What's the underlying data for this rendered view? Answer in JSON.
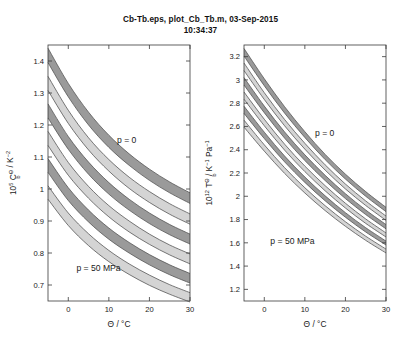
{
  "figure": {
    "title_line1": "Cb-Tb.eps, plot_Cb_Tb.m, 03-Sep-2015",
    "title_line2": "10:34:37",
    "background": "#ffffff"
  },
  "colors": {
    "band_dark": "#9a9a9a",
    "band_light": "#d4d4d4",
    "curve_line": "#4d4d4d",
    "axis": "#3a3a3a",
    "text": "#1a1a1a"
  },
  "panels": [
    {
      "id": "left",
      "annotations": [
        {
          "text": "p = 0",
          "x": 12.0,
          "y": 1.145
        },
        {
          "text": "p = 50 MPa",
          "x": 2.0,
          "y": 0.745
        }
      ]
    },
    {
      "id": "right",
      "annotations": [
        {
          "text": "p = 0",
          "x": 12.5,
          "y": 2.52
        },
        {
          "text": "p = 50 MPa",
          "x": 1.5,
          "y": 1.59
        }
      ]
    }
  ],
  "chart_data": [
    {
      "type": "line",
      "id": "left-panel",
      "title": "",
      "xlabel": "Θ / °C",
      "ylabel": "10⁵ C_b^Θ / K⁻²",
      "ylabel_parts": {
        "prefix": "10",
        "prefix_sup": "5",
        "symbol": "C",
        "symbol_sub": "b",
        "symbol_sup": "Θ",
        "unit": "/ K",
        "unit_sup": "−2"
      },
      "xlim": [
        -5,
        30
      ],
      "ylim": [
        0.65,
        1.45
      ],
      "xticks": [
        0,
        10,
        20,
        30
      ],
      "yticks": [
        0.7,
        0.8,
        0.9,
        1,
        1.1,
        1.2,
        1.3,
        1.4
      ],
      "xticklabels": [
        "0",
        "10",
        "20",
        "30"
      ],
      "yticklabels": [
        "0.7",
        "0.8",
        "0.9",
        "1",
        "1.1",
        "1.2",
        "1.3",
        "1.4"
      ],
      "grid": false,
      "legend": "none",
      "x": [
        -5,
        0,
        5,
        10,
        15,
        20,
        25,
        30
      ],
      "series": [
        {
          "name": "p = 0 upper",
          "pressure_MPa": 0,
          "bound": "upper",
          "values": [
            1.44,
            1.33,
            1.24,
            1.168,
            1.11,
            1.062,
            1.022,
            0.988
          ]
        },
        {
          "name": "p = 0 lower",
          "pressure_MPa": 0,
          "bound": "lower",
          "values": [
            1.395,
            1.288,
            1.2,
            1.13,
            1.074,
            1.027,
            0.988,
            0.955
          ]
        },
        {
          "name": "p = 10 upper",
          "pressure_MPa": 10,
          "bound": "upper",
          "values": [
            1.352,
            1.246,
            1.16,
            1.092,
            1.037,
            0.992,
            0.954,
            0.922
          ]
        },
        {
          "name": "p = 10 lower",
          "pressure_MPa": 10,
          "bound": "lower",
          "values": [
            1.308,
            1.205,
            1.122,
            1.056,
            1.002,
            0.958,
            0.921,
            0.89
          ]
        },
        {
          "name": "p = 20 upper",
          "pressure_MPa": 20,
          "bound": "upper",
          "values": [
            1.266,
            1.164,
            1.084,
            1.02,
            0.968,
            0.925,
            0.889,
            0.859
          ]
        },
        {
          "name": "p = 20 lower",
          "pressure_MPa": 20,
          "bound": "lower",
          "values": [
            1.222,
            1.124,
            1.046,
            0.984,
            0.934,
            0.892,
            0.857,
            0.828
          ]
        },
        {
          "name": "p = 30 upper",
          "pressure_MPa": 30,
          "bound": "upper",
          "values": [
            1.18,
            1.083,
            1.008,
            0.948,
            0.9,
            0.859,
            0.825,
            0.797
          ]
        },
        {
          "name": "p = 30 lower",
          "pressure_MPa": 30,
          "bound": "lower",
          "values": [
            1.136,
            1.043,
            0.971,
            0.913,
            0.866,
            0.827,
            0.794,
            0.766
          ]
        },
        {
          "name": "p = 40 upper",
          "pressure_MPa": 40,
          "bound": "upper",
          "values": [
            1.095,
            1.004,
            0.934,
            0.878,
            0.833,
            0.795,
            0.763,
            0.736
          ]
        },
        {
          "name": "p = 40 lower",
          "pressure_MPa": 40,
          "bound": "lower",
          "values": [
            1.052,
            0.964,
            0.897,
            0.843,
            0.8,
            0.763,
            0.732,
            0.706
          ]
        },
        {
          "name": "p = 50 upper",
          "pressure_MPa": 50,
          "bound": "upper",
          "values": [
            1.01,
            0.925,
            0.86,
            0.808,
            0.766,
            0.731,
            0.701,
            0.676
          ]
        },
        {
          "name": "p = 50 lower",
          "pressure_MPa": 50,
          "bound": "lower",
          "values": [
            0.968,
            0.886,
            0.823,
            0.773,
            0.733,
            0.699,
            0.671,
            0.647
          ]
        }
      ],
      "bands": [
        {
          "pressure_MPa": 0,
          "shade": "dark"
        },
        {
          "pressure_MPa": 10,
          "shade": "light"
        },
        {
          "pressure_MPa": 20,
          "shade": "dark"
        },
        {
          "pressure_MPa": 30,
          "shade": "light"
        },
        {
          "pressure_MPa": 40,
          "shade": "dark"
        },
        {
          "pressure_MPa": 50,
          "shade": "light"
        }
      ]
    },
    {
      "type": "line",
      "id": "right-panel",
      "title": "",
      "xlabel": "Θ / °C",
      "ylabel": "10¹² T_b^Θ / K⁻¹ Pa⁻¹",
      "ylabel_parts": {
        "prefix": "10",
        "prefix_sup": "12",
        "symbol": "T",
        "symbol_sub": "b",
        "symbol_sup": "Θ",
        "unit": "/ K",
        "unit_sup": "−1",
        "unit2": "Pa",
        "unit2_sup": "−1"
      },
      "xlim": [
        -5,
        30
      ],
      "ylim": [
        1.1,
        3.3
      ],
      "xticks": [
        0,
        10,
        20,
        30
      ],
      "yticks": [
        1.2,
        1.4,
        1.6,
        1.8,
        2,
        2.2,
        2.4,
        2.6,
        2.8,
        3,
        3.2
      ],
      "xticklabels": [
        "0",
        "10",
        "20",
        "30"
      ],
      "yticklabels": [
        "1.2",
        "1.4",
        "1.6",
        "1.8",
        "2",
        "2.2",
        "2.4",
        "2.6",
        "2.8",
        "3",
        "3.2"
      ],
      "grid": false,
      "legend": "none",
      "x": [
        -5,
        0,
        5,
        10,
        15,
        20,
        25,
        30
      ],
      "series": [
        {
          "name": "p = 0 upper",
          "pressure_MPa": 0,
          "bound": "upper",
          "values": [
            3.27,
            3.01,
            2.77,
            2.555,
            2.36,
            2.19,
            2.04,
            1.905
          ]
        },
        {
          "name": "p = 0 lower",
          "pressure_MPa": 0,
          "bound": "lower",
          "values": [
            3.205,
            2.95,
            2.715,
            2.505,
            2.315,
            2.148,
            2.0,
            1.868
          ]
        },
        {
          "name": "p = 10 upper",
          "pressure_MPa": 10,
          "bound": "upper",
          "values": [
            3.145,
            2.89,
            2.66,
            2.455,
            2.27,
            2.105,
            1.96,
            1.83
          ]
        },
        {
          "name": "p = 10 lower",
          "pressure_MPa": 10,
          "bound": "lower",
          "values": [
            3.08,
            2.832,
            2.606,
            2.405,
            2.225,
            2.063,
            1.921,
            1.793
          ]
        },
        {
          "name": "p = 20 upper",
          "pressure_MPa": 20,
          "bound": "upper",
          "values": [
            3.02,
            2.775,
            2.553,
            2.356,
            2.18,
            2.022,
            1.882,
            1.757
          ]
        },
        {
          "name": "p = 20 lower",
          "pressure_MPa": 20,
          "bound": "lower",
          "values": [
            2.956,
            2.718,
            2.5,
            2.307,
            2.135,
            1.98,
            1.843,
            1.72
          ]
        },
        {
          "name": "p = 30 upper",
          "pressure_MPa": 30,
          "bound": "upper",
          "values": [
            2.896,
            2.662,
            2.448,
            2.259,
            2.091,
            1.94,
            1.805,
            1.685
          ]
        },
        {
          "name": "p = 30 lower",
          "pressure_MPa": 30,
          "bound": "lower",
          "values": [
            2.834,
            2.606,
            2.397,
            2.212,
            2.047,
            1.899,
            1.767,
            1.65
          ]
        },
        {
          "name": "p = 40 upper",
          "pressure_MPa": 40,
          "bound": "upper",
          "values": [
            2.774,
            2.551,
            2.346,
            2.165,
            2.004,
            1.859,
            1.73,
            1.615
          ]
        },
        {
          "name": "p = 40 lower",
          "pressure_MPa": 40,
          "bound": "lower",
          "values": [
            2.712,
            2.496,
            2.296,
            2.119,
            1.961,
            1.82,
            1.693,
            1.581
          ]
        },
        {
          "name": "p = 50 upper",
          "pressure_MPa": 50,
          "bound": "upper",
          "values": [
            2.654,
            2.442,
            2.246,
            2.073,
            1.919,
            1.781,
            1.657,
            1.546
          ]
        },
        {
          "name": "p = 50 lower",
          "pressure_MPa": 50,
          "bound": "lower",
          "values": [
            2.594,
            2.388,
            2.197,
            2.028,
            1.877,
            1.742,
            1.621,
            1.513
          ]
        }
      ],
      "bands": [
        {
          "pressure_MPa": 0,
          "shade": "dark"
        },
        {
          "pressure_MPa": 10,
          "shade": "light"
        },
        {
          "pressure_MPa": 20,
          "shade": "dark"
        },
        {
          "pressure_MPa": 30,
          "shade": "light"
        },
        {
          "pressure_MPa": 40,
          "shade": "dark"
        },
        {
          "pressure_MPa": 50,
          "shade": "light"
        }
      ]
    }
  ]
}
